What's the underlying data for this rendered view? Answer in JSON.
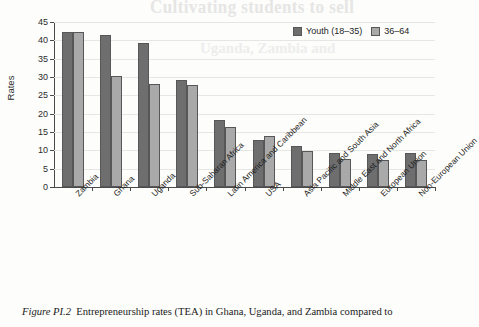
{
  "page": {
    "ghost_text_top": "Cultivating students to sell",
    "ghost_text_second": "Uganda, Zambia and"
  },
  "caption": {
    "figure_number": "Figure PI.2",
    "text": "Entrepreneurship rates (TEA) in Ghana, Uganda, and Zambia compared to"
  },
  "legend": {
    "position": "top-right",
    "items": [
      {
        "label": "Youth (18–35)",
        "color": "#6e6e6e",
        "key": "youth"
      },
      {
        "label": "36–64",
        "color": "#a9a9a9",
        "key": "older"
      }
    ]
  },
  "chart_data": {
    "type": "bar",
    "title": "",
    "subtitle": "",
    "xlabel": "",
    "ylabel": "Rates",
    "ylim": [
      0,
      45
    ],
    "ytick_step": 5,
    "yticks": [
      0,
      5,
      10,
      15,
      20,
      25,
      30,
      35,
      40,
      45
    ],
    "ytick_labels": [
      "0",
      "5",
      "10",
      "15",
      "20",
      "25",
      "30",
      "35",
      "40",
      "45"
    ],
    "grid": true,
    "grid_axis": "y",
    "legend_position": "top-right",
    "categories": [
      "Zambia",
      "Ghana",
      "Uganda",
      "Sub-Saharan Africa",
      "Latin America and Caribbean",
      "USA",
      "Asia Pacific and South Asia",
      "Middle East and North Africa",
      "European Union",
      "Non-European Union"
    ],
    "series": [
      {
        "name": "Youth (18–35)",
        "color": "#6e6e6e",
        "values": [
          42.4,
          41.4,
          39.4,
          29.2,
          18.3,
          12.8,
          11.1,
          9.4,
          9.1,
          9.2
        ]
      },
      {
        "name": "36–64",
        "color": "#a9a9a9",
        "values": [
          42.4,
          30.4,
          28.1,
          27.8,
          16.5,
          13.8,
          9.9,
          7.7,
          7.4,
          7.5
        ]
      }
    ]
  }
}
